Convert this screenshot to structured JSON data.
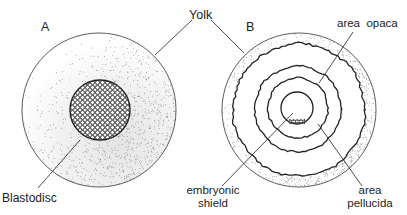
{
  "panels": {
    "a": {
      "letter": "A",
      "labels": {
        "yolk": "Yolk",
        "blastodisc": "Blastodisc"
      }
    },
    "b": {
      "letter": "B",
      "labels": {
        "area_opaca": "area  opaca",
        "embryonic_shield_line1": "embryonic",
        "embryonic_shield_line2": "shield",
        "area_pellucida_line1": "area",
        "area_pellucida_line2": "pellucida"
      }
    }
  },
  "colors": {
    "ink": "#222222",
    "stipple": "#555555",
    "background": "#ffffff"
  }
}
